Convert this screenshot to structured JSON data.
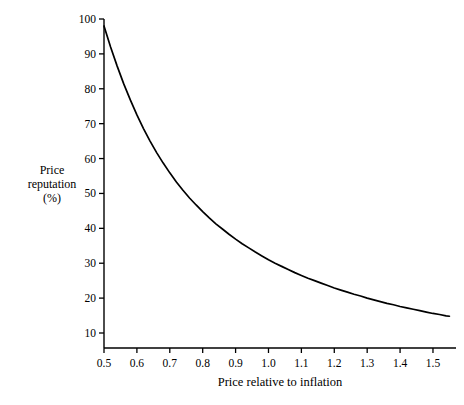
{
  "chart_data": {
    "type": "line",
    "title": "",
    "xlabel": "Price relative to inflation",
    "ylabel": "Price reputation (%)",
    "ylabel_lines": [
      "Price",
      "reputation",
      "(%)"
    ],
    "xlim": [
      0.5,
      1.57
    ],
    "ylim": [
      5,
      102
    ],
    "grid": false,
    "legend": false,
    "xticks": [
      0.5,
      0.6,
      0.7,
      0.8,
      0.9,
      1.0,
      1.1,
      1.2,
      1.3,
      1.4,
      1.5
    ],
    "xtick_labels": [
      "0.5",
      "0.6",
      "0.7",
      "0.8",
      "0.9",
      "1.0",
      "1.1",
      "1.2",
      "1.3",
      "1.4",
      "1.5"
    ],
    "yticks": [
      10,
      20,
      30,
      40,
      50,
      60,
      70,
      80,
      90,
      100
    ],
    "ytick_labels": [
      "10",
      "20",
      "30",
      "40",
      "50",
      "60",
      "70",
      "80",
      "90",
      "100"
    ],
    "series": [
      {
        "name": "Price reputation",
        "color": "#000000",
        "x": [
          0.5,
          0.52,
          0.54,
          0.56,
          0.58,
          0.6,
          0.62,
          0.64,
          0.66,
          0.68,
          0.7,
          0.72,
          0.74,
          0.76,
          0.78,
          0.8,
          0.82,
          0.84,
          0.86,
          0.88,
          0.9,
          0.92,
          0.94,
          0.96,
          0.98,
          1.0,
          1.02,
          1.04,
          1.06,
          1.08,
          1.1,
          1.12,
          1.14,
          1.16,
          1.18,
          1.2,
          1.22,
          1.24,
          1.26,
          1.28,
          1.3,
          1.32,
          1.34,
          1.36,
          1.38,
          1.4,
          1.42,
          1.44,
          1.46,
          1.48,
          1.5,
          1.52,
          1.54,
          1.55
        ],
        "values": [
          98.0,
          92.0,
          86.5,
          81.4,
          76.8,
          72.5,
          68.6,
          65.0,
          61.7,
          58.7,
          55.9,
          53.3,
          50.9,
          48.7,
          46.7,
          44.8,
          43.0,
          41.3,
          39.8,
          38.3,
          36.9,
          35.6,
          34.4,
          33.2,
          32.1,
          31.0,
          30.0,
          29.1,
          28.2,
          27.3,
          26.5,
          25.7,
          25.0,
          24.3,
          23.6,
          22.9,
          22.3,
          21.7,
          21.1,
          20.6,
          20.0,
          19.5,
          19.0,
          18.5,
          18.1,
          17.6,
          17.2,
          16.8,
          16.4,
          16.0,
          15.6,
          15.3,
          14.9,
          14.8
        ]
      }
    ],
    "annotations": []
  }
}
